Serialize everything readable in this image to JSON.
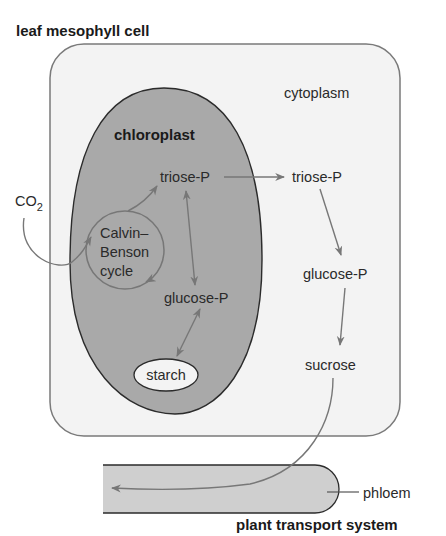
{
  "diagram": {
    "title": "leaf mesophyll cell",
    "footer_title": "plant transport system",
    "regions": {
      "cytoplasm": "cytoplasm",
      "chloroplast": "chloroplast",
      "phloem": "phloem"
    },
    "nodes": {
      "co2": "CO",
      "co2_sub": "2",
      "calvin_line1": "Calvin–",
      "calvin_line2": "Benson",
      "calvin_line3": "cycle",
      "triose_chloro": "triose-P",
      "glucose_chloro": "glucose-P",
      "starch": "starch",
      "triose_cyto": "triose-P",
      "glucose_cyto": "glucose-P",
      "sucrose": "sucrose"
    },
    "edges": [
      {
        "from": "CO2",
        "to": "Calvin–Benson cycle"
      },
      {
        "from": "Calvin–Benson cycle",
        "to": "triose-P (chloroplast)"
      },
      {
        "from": "triose-P (chloroplast)",
        "to": "glucose-P (chloroplast)",
        "bidirectional": true
      },
      {
        "from": "glucose-P (chloroplast)",
        "to": "starch",
        "bidirectional": true
      },
      {
        "from": "triose-P (chloroplast)",
        "to": "triose-P (cytoplasm)"
      },
      {
        "from": "triose-P (cytoplasm)",
        "to": "glucose-P (cytoplasm)"
      },
      {
        "from": "glucose-P (cytoplasm)",
        "to": "sucrose"
      },
      {
        "from": "sucrose",
        "to": "phloem"
      }
    ],
    "colors": {
      "cell_fill": "#f3f3f3",
      "cell_stroke": "#7a7a7a",
      "chloroplast_fill": "#a9a9a9",
      "chloroplast_stroke": "#2b2b2b",
      "phloem_fill": "#cfcfcf",
      "arrow": "#777777",
      "text": "#2a2a2a"
    }
  }
}
